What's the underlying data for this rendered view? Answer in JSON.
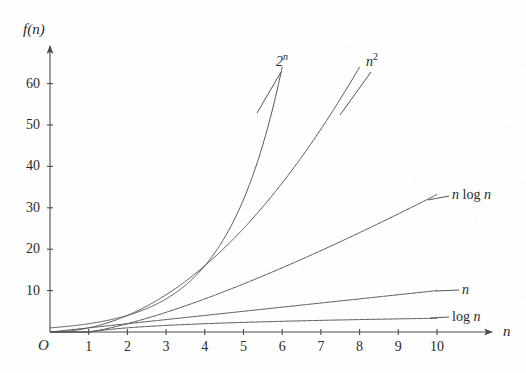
{
  "chart_data": {
    "type": "line",
    "title": "",
    "xlabel": "n",
    "ylabel": "f(n)",
    "origin_label": "O",
    "xlim": [
      0,
      11.5
    ],
    "ylim": [
      0,
      66
    ],
    "grid": false,
    "legend_position": "inline-end-labels",
    "log_base": 2,
    "x_ticks": [
      "1",
      "2",
      "3",
      "4",
      "5",
      "6",
      "7",
      "8",
      "9",
      "10"
    ],
    "x_tick_values": [
      1,
      2,
      3,
      4,
      5,
      6,
      7,
      8,
      9,
      10
    ],
    "y_ticks": [
      "10",
      "20",
      "30",
      "40",
      "50",
      "60"
    ],
    "y_tick_values": [
      10,
      20,
      30,
      40,
      50,
      60
    ],
    "series": [
      {
        "name": "2^n",
        "label_html": "2<span class=\"sup\">n</span>",
        "label_plain": "2ⁿ",
        "formula": "2**x",
        "x": [
          0,
          0.5,
          1,
          1.5,
          2,
          2.5,
          3,
          3.5,
          4,
          4.5,
          5,
          5.5,
          6
        ],
        "values": [
          1,
          1.41,
          2,
          2.83,
          4,
          5.66,
          8,
          11.31,
          16,
          22.63,
          32,
          45.25,
          64
        ],
        "label_anchor_x": 6,
        "label_anchor_y": 64
      },
      {
        "name": "n^2",
        "label_html": "n<span class=\"sup rm\">2</span>",
        "label_plain": "n²",
        "formula": "x**2",
        "x": [
          0,
          1,
          2,
          3,
          4,
          5,
          6,
          7,
          8
        ],
        "values": [
          0,
          1,
          4,
          9,
          16,
          25,
          36,
          49,
          64
        ],
        "label_anchor_x": 8,
        "label_anchor_y": 64
      },
      {
        "name": "n log n",
        "label_html": "n <span class=\"rm\">log</span> n",
        "label_plain": "n log n",
        "formula": "x*log2(x)",
        "x": [
          0,
          1,
          2,
          3,
          4,
          5,
          6,
          7,
          8,
          9,
          10
        ],
        "values": [
          0,
          0,
          2,
          4.75,
          8,
          11.61,
          15.51,
          19.65,
          24,
          28.53,
          33.22
        ],
        "label_anchor_x": 10,
        "label_anchor_y": 33.2
      },
      {
        "name": "n",
        "label_html": "n",
        "label_plain": "n",
        "formula": "x",
        "x": [
          0,
          10
        ],
        "values": [
          0,
          10
        ],
        "label_anchor_x": 10,
        "label_anchor_y": 10
      },
      {
        "name": "log n",
        "label_html": "<span class=\"rm\">log</span> n",
        "label_plain": "log n",
        "formula": "log2(x)",
        "x": [
          0,
          1,
          2,
          3,
          4,
          5,
          6,
          7,
          8,
          9,
          10
        ],
        "values": [
          0,
          0,
          1,
          1.58,
          2,
          2.32,
          2.58,
          2.81,
          3,
          3.17,
          3.32
        ],
        "label_anchor_x": 10,
        "label_anchor_y": 3.3
      }
    ],
    "colors": {
      "axis": "#4a4a4a",
      "curve": "#555555",
      "text": "#2b2b2b",
      "background": "#fefefe"
    }
  }
}
